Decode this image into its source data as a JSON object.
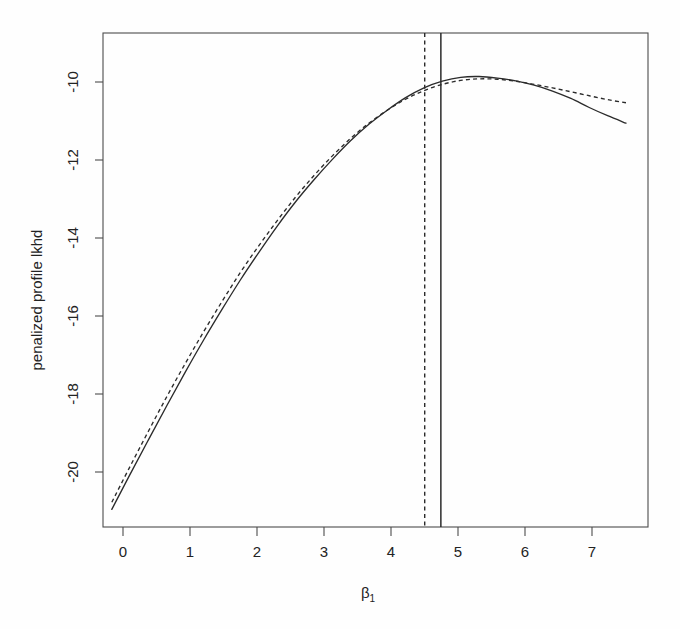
{
  "figure": {
    "background_color": "#fefefe",
    "line_color": "#2b2b2b",
    "axis_color": "#4c4c4c"
  },
  "axes": {
    "x_title": "β",
    "x_title_sub": "1",
    "y_title": "penalized profile lkhd",
    "x_ticks": [
      "0",
      "1",
      "2",
      "3",
      "4",
      "5",
      "6",
      "7"
    ],
    "y_ticks": [
      "-10",
      "-12",
      "-14",
      "-16",
      "-18",
      "-20"
    ]
  },
  "chart_data": {
    "type": "line",
    "title": "",
    "xlabel": "beta_1",
    "ylabel": "penalized profile lkhd",
    "xlim": [
      -0.12,
      7.3
    ],
    "ylim": [
      -21.45,
      -8.85
    ],
    "x_ticks": [
      0,
      1,
      2,
      3,
      4,
      5,
      6,
      7
    ],
    "y_ticks": [
      -10,
      -12,
      -14,
      -16,
      -18,
      -20
    ],
    "grid": false,
    "legend": "none",
    "series": [
      {
        "name": "penalized profile likelihood (solid)",
        "style": "solid",
        "x": [
          0.0,
          0.25,
          0.5,
          0.75,
          1.0,
          1.25,
          1.5,
          1.75,
          2.0,
          2.25,
          2.5,
          2.75,
          3.0,
          3.25,
          3.5,
          3.75,
          4.0,
          4.25,
          4.5,
          4.75,
          5.0,
          5.25,
          5.5,
          5.75,
          6.0,
          6.25,
          6.5,
          6.75,
          7.0
        ],
        "y": [
          -21.0,
          -20.1,
          -19.22,
          -18.35,
          -17.5,
          -16.68,
          -15.9,
          -15.15,
          -14.45,
          -13.78,
          -13.16,
          -12.6,
          -12.08,
          -11.6,
          -11.18,
          -10.82,
          -10.5,
          -10.25,
          -10.08,
          -9.98,
          -9.96,
          -10.0,
          -10.07,
          -10.18,
          -10.33,
          -10.52,
          -10.75,
          -10.96,
          -11.15
        ]
      },
      {
        "name": "approximate / unpenalized profile likelihood (dashed)",
        "style": "dashed",
        "x": [
          0.0,
          0.25,
          0.5,
          0.75,
          1.0,
          1.25,
          1.5,
          1.75,
          2.0,
          2.25,
          2.5,
          2.75,
          3.0,
          3.25,
          3.5,
          3.75,
          4.0,
          4.25,
          4.5,
          4.75,
          5.0,
          5.25,
          5.5,
          5.75,
          6.0,
          6.25,
          6.5,
          6.75,
          7.0
        ],
        "y": [
          -20.82,
          -19.9,
          -19.0,
          -18.12,
          -17.28,
          -16.47,
          -15.7,
          -14.96,
          -14.28,
          -13.64,
          -13.04,
          -12.49,
          -11.99,
          -11.54,
          -11.15,
          -10.82,
          -10.54,
          -10.32,
          -10.16,
          -10.06,
          -10.02,
          -10.03,
          -10.08,
          -10.16,
          -10.25,
          -10.35,
          -10.45,
          -10.55,
          -10.63
        ]
      }
    ],
    "annotations": [
      {
        "name": "penalized-mle-vline",
        "type": "vertical-line",
        "style": "solid",
        "x": 4.48,
        "label": "penalized MLE"
      },
      {
        "name": "mle-vline",
        "type": "vertical-line",
        "style": "dashed",
        "x": 4.26,
        "label": "MLE"
      }
    ]
  }
}
